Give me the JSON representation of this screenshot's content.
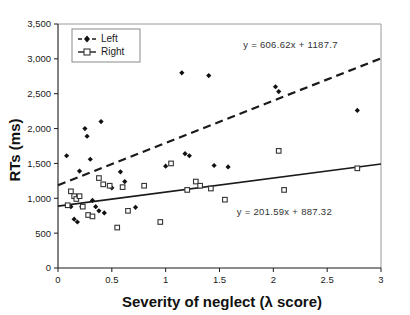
{
  "chart_data": {
    "type": "scatter",
    "title": "",
    "xlabel": "Severity of neglect (λ score)",
    "ylabel": "RTs (ms)",
    "xlim": [
      0,
      3
    ],
    "ylim": [
      0,
      3500
    ],
    "xticks": [
      0,
      0.5,
      1,
      1.5,
      2,
      2.5,
      3
    ],
    "xticklabels": [
      "0",
      "0.5",
      "1",
      "1.5",
      "2",
      "2.5",
      "3"
    ],
    "yticks": [
      0,
      500,
      1000,
      1500,
      2000,
      2500,
      3000,
      3500
    ],
    "yticklabels": [
      "0",
      "500",
      "1,000",
      "1,500",
      "2,000",
      "2,500",
      "3,000",
      "3,500"
    ],
    "grid": false,
    "legend_position": "upper-left",
    "series": [
      {
        "name": "Left",
        "marker": "filled-diamond",
        "line": "dashed",
        "color": "#111111",
        "points": [
          [
            0.08,
            1610
          ],
          [
            0.1,
            900
          ],
          [
            0.12,
            880
          ],
          [
            0.15,
            700
          ],
          [
            0.18,
            660
          ],
          [
            0.2,
            1390
          ],
          [
            0.22,
            880
          ],
          [
            0.25,
            2000
          ],
          [
            0.27,
            1890
          ],
          [
            0.3,
            1560
          ],
          [
            0.32,
            970
          ],
          [
            0.35,
            880
          ],
          [
            0.38,
            820
          ],
          [
            0.4,
            2100
          ],
          [
            0.43,
            790
          ],
          [
            0.5,
            1150
          ],
          [
            0.58,
            1380
          ],
          [
            0.62,
            1240
          ],
          [
            0.72,
            870
          ],
          [
            1.0,
            1460
          ],
          [
            1.15,
            2800
          ],
          [
            1.18,
            1640
          ],
          [
            1.22,
            1610
          ],
          [
            1.4,
            2760
          ],
          [
            1.45,
            1470
          ],
          [
            1.58,
            1450
          ],
          [
            2.02,
            2600
          ],
          [
            2.05,
            2530
          ],
          [
            2.78,
            2260
          ]
        ]
      },
      {
        "name": "Right",
        "marker": "open-square",
        "line": "solid",
        "color": "#333333",
        "points": [
          [
            0.09,
            900
          ],
          [
            0.12,
            1100
          ],
          [
            0.15,
            1030
          ],
          [
            0.17,
            990
          ],
          [
            0.2,
            1030
          ],
          [
            0.23,
            880
          ],
          [
            0.28,
            760
          ],
          [
            0.32,
            740
          ],
          [
            0.38,
            1290
          ],
          [
            0.42,
            1200
          ],
          [
            0.48,
            1180
          ],
          [
            0.55,
            580
          ],
          [
            0.6,
            1160
          ],
          [
            0.65,
            820
          ],
          [
            0.8,
            1180
          ],
          [
            0.95,
            660
          ],
          [
            1.05,
            1500
          ],
          [
            1.2,
            1120
          ],
          [
            1.28,
            1240
          ],
          [
            1.32,
            1180
          ],
          [
            1.42,
            1140
          ],
          [
            1.55,
            980
          ],
          [
            2.05,
            1680
          ],
          [
            2.1,
            1120
          ],
          [
            2.78,
            1430
          ]
        ]
      }
    ],
    "fits": [
      {
        "series": "Left",
        "equation": "y = 606.62x + 1187.7",
        "slope": 606.62,
        "intercept": 1187.7,
        "style": "dashed",
        "label_x": 1.72,
        "label_y": 3150
      },
      {
        "series": "Right",
        "equation": "y = 201.59x + 887.32",
        "slope": 201.59,
        "intercept": 887.32,
        "style": "solid",
        "label_x": 1.66,
        "label_y": 760
      }
    ],
    "legend": [
      {
        "label": "Left",
        "marker": "filled-diamond",
        "line": "dashed"
      },
      {
        "label": "Right",
        "marker": "open-square",
        "line": "solid"
      }
    ]
  },
  "caption": {
    "text": ""
  }
}
